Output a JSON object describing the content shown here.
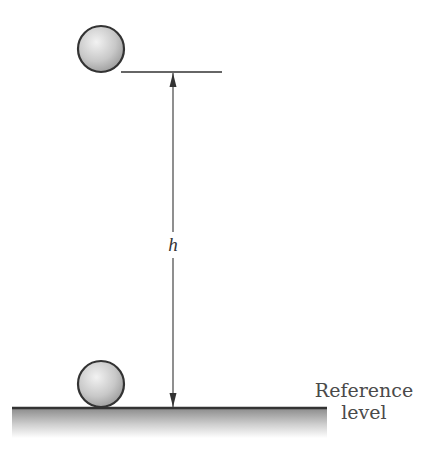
{
  "diagram": {
    "type": "gravitational-potential-energy-height",
    "labels": {
      "height": "h",
      "reference_line1": "Reference",
      "reference_line2": "level"
    },
    "objects": [
      {
        "name": "ball-top",
        "position": "at height h above reference"
      },
      {
        "name": "ball-bottom",
        "position": "resting on reference level"
      }
    ],
    "colors": {
      "ball_fill_light": "#eeeeee",
      "ball_fill_dark": "#a9a9a9",
      "ball_stroke": "#333333",
      "line": "#333333",
      "ground_top": "#8c8c8c",
      "ground_bottom": "#ffffff"
    }
  }
}
